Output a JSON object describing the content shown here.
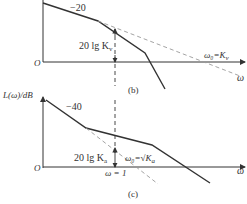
{
  "figure_b": {
    "slope_label": "−20",
    "gain_label": "20 lg K",
    "gain_sub": "v",
    "crossover_label": "ω₀=K",
    "crossover_sub": "v",
    "origin_label": "O",
    "x_axis_label": "ω",
    "caption": "(b)"
  },
  "figure_c": {
    "y_axis_label": "L(ω)/dB",
    "slope_label": "−40",
    "gain_label": "20 lg K",
    "gain_sub": "a",
    "crossover_label": "ω₀=√K",
    "crossover_sub": "a",
    "omega_one_label": "ω = 1",
    "origin_label": "O",
    "x_axis_label": "ω",
    "caption": "(c)"
  },
  "colors": {
    "line": "#333333",
    "dashed": "#9a9a9a"
  }
}
